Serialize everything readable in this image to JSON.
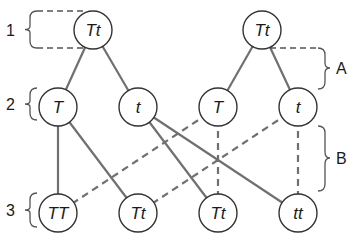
{
  "diagram": {
    "colors": {
      "line": "#707070",
      "node_stroke": "#333333",
      "node_fill": "#ffffff",
      "text": "#1a1a1a"
    },
    "nodes": [
      {
        "id": "p1",
        "label": "Tt",
        "x": 93,
        "y": 30
      },
      {
        "id": "p2",
        "label": "Tt",
        "x": 262,
        "y": 30
      },
      {
        "id": "g1",
        "label": "T",
        "x": 58,
        "y": 107
      },
      {
        "id": "g2",
        "label": "t",
        "x": 138,
        "y": 107
      },
      {
        "id": "g3",
        "label": "T",
        "x": 218,
        "y": 107
      },
      {
        "id": "g4",
        "label": "t",
        "x": 298,
        "y": 107
      },
      {
        "id": "o1",
        "label": "TT",
        "x": 58,
        "y": 213
      },
      {
        "id": "o2",
        "label": "Tt",
        "x": 138,
        "y": 213
      },
      {
        "id": "o3",
        "label": "Tt",
        "x": 218,
        "y": 213
      },
      {
        "id": "o4",
        "label": "tt",
        "x": 298,
        "y": 213
      }
    ],
    "solid_edges": [
      [
        "p1",
        "g1"
      ],
      [
        "p1",
        "g2"
      ],
      [
        "p2",
        "g3"
      ],
      [
        "p2",
        "g4"
      ],
      [
        "g1",
        "o1"
      ],
      [
        "g1",
        "o2"
      ],
      [
        "g2",
        "o3"
      ],
      [
        "g2",
        "o4"
      ]
    ],
    "dashed_edges": [
      [
        "g3",
        "o1"
      ],
      [
        "g4",
        "o2"
      ],
      [
        "g3",
        "o3"
      ],
      [
        "g4",
        "o4"
      ]
    ],
    "row_labels": [
      {
        "text": "1",
        "y": 40
      },
      {
        "text": "2",
        "y": 110
      },
      {
        "text": "3",
        "y": 216
      }
    ],
    "brackets": [
      {
        "text": "A"
      },
      {
        "text": "B"
      }
    ]
  }
}
